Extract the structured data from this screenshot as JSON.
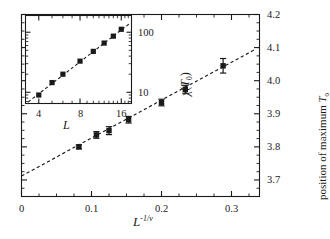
{
  "figure": {
    "background": "#ffffff",
    "ink": "#1a1a1a"
  },
  "chart_data": [
    {
      "id": "main",
      "type": "scatter",
      "title": "",
      "xlabel": "L^-1/ν",
      "xlabel_base": "L",
      "xlabel_exp": "-1/ν",
      "ylabel": "position of maximum T₀",
      "ylabel_prefix": "position of maximum ",
      "ylabel_symbol": "T",
      "ylabel_symbol_sub": "0",
      "xlim": [
        0.0,
        0.34
      ],
      "ylim": [
        3.65,
        4.2
      ],
      "xticks": [
        0.0,
        0.1,
        0.2,
        0.3
      ],
      "xticklabels": [
        "0",
        "0.1",
        "0.2",
        "0.3"
      ],
      "xminor_step": 0.025,
      "yticks": [
        3.7,
        3.8,
        3.9,
        4.0,
        4.1,
        4.2
      ],
      "yticklabels": [
        "3.7",
        "3.8",
        "3.9",
        "4.0",
        "4.1",
        "4.2"
      ],
      "yminor_step": 0.025,
      "y_axis_side": "right",
      "grid": false,
      "legend": null,
      "marker": "filled-square",
      "x": [
        0.082,
        0.107,
        0.125,
        0.153,
        0.2,
        0.234,
        0.288
      ],
      "y": [
        3.8,
        3.836,
        3.849,
        3.882,
        3.934,
        3.974,
        4.045
      ],
      "yerr": [
        0.006,
        0.01,
        0.012,
        0.01,
        0.01,
        0.012,
        0.022
      ],
      "fit": {
        "type": "line",
        "style": "dashed",
        "x": [
          0.0,
          0.335
        ],
        "y": [
          3.712,
          4.096
        ],
        "intercept": 3.712,
        "slope": 1.146
      }
    },
    {
      "id": "inset",
      "type": "scatter",
      "title": "",
      "xlabel": "L",
      "ylabel": "χ(T₀)",
      "ylabel_symbol": "χ",
      "ylabel_arg": "T",
      "ylabel_arg_sub": "0",
      "xscale": "log",
      "yscale": "log",
      "xlim": [
        3.2,
        19.0
      ],
      "ylim": [
        6.5,
        190.0
      ],
      "xticks": [
        4,
        8,
        16
      ],
      "xticklabels": [
        "4",
        "8",
        "16"
      ],
      "yticks": [
        10,
        100
      ],
      "yticklabels": [
        "10",
        "100"
      ],
      "y_axis_side": "right",
      "grid": false,
      "legend": null,
      "marker": "filled-square",
      "x": [
        4,
        5,
        6,
        8,
        10,
        12,
        14,
        16
      ],
      "y": [
        9.0,
        14.5,
        20.0,
        33.0,
        48.0,
        66.0,
        86.0,
        112.0
      ],
      "fit": {
        "type": "line",
        "style": "dashed",
        "x": [
          3.35,
          18.2
        ],
        "y": [
          6.9,
          137.0
        ]
      }
    }
  ]
}
